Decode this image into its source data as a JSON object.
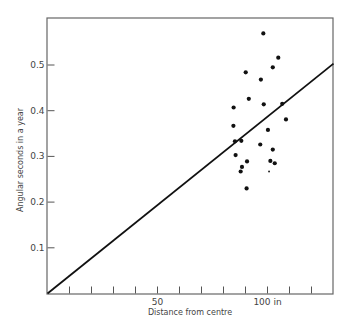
{
  "chart_data": {
    "type": "scatter",
    "title": "",
    "xlabel": "Distance from centre",
    "ylabel": "Angular seconds in a year",
    "xlim": [
      0,
      130
    ],
    "ylim": [
      0,
      0.6
    ],
    "grid": false,
    "x_tick_labels": [
      {
        "value": 50,
        "label": "50"
      },
      {
        "value": 100,
        "label": "100 in"
      }
    ],
    "x_minor_ticks": [
      10,
      20,
      30,
      40,
      50,
      60,
      70,
      80,
      90,
      100,
      110,
      120
    ],
    "y_ticks": [
      {
        "value": 0.1,
        "label": "0.1"
      },
      {
        "value": 0.2,
        "label": "0.2"
      },
      {
        "value": 0.3,
        "label": "0.3"
      },
      {
        "value": 0.4,
        "label": "0.4"
      },
      {
        "value": 0.5,
        "label": "0.5"
      }
    ],
    "series": [
      {
        "name": "observations",
        "type": "scatter",
        "points": [
          [
            98.1,
            0.569
          ],
          [
            104.9,
            0.516
          ],
          [
            102.4,
            0.495
          ],
          [
            90.1,
            0.484
          ],
          [
            97.0,
            0.468
          ],
          [
            91.5,
            0.426
          ],
          [
            84.6,
            0.407
          ],
          [
            98.3,
            0.414
          ],
          [
            106.7,
            0.415
          ],
          [
            108.4,
            0.381
          ],
          [
            84.5,
            0.367
          ],
          [
            100.2,
            0.358
          ],
          [
            85.2,
            0.333
          ],
          [
            88.1,
            0.334
          ],
          [
            96.7,
            0.326
          ],
          [
            102.4,
            0.315
          ],
          [
            85.5,
            0.303
          ],
          [
            90.7,
            0.289
          ],
          [
            101.3,
            0.29
          ],
          [
            103.3,
            0.285
          ],
          [
            88.4,
            0.277
          ],
          [
            87.8,
            0.267
          ],
          [
            100.7,
            0.267
          ],
          [
            90.5,
            0.23
          ]
        ]
      },
      {
        "name": "linear fit",
        "type": "line",
        "points": [
          [
            0,
            0
          ],
          [
            130,
            0.503
          ]
        ]
      }
    ]
  }
}
